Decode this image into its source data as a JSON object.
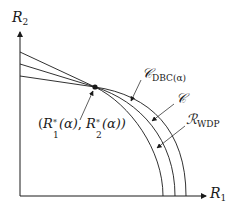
{
  "diagram": {
    "axes": {
      "y_label": {
        "symbol": "R",
        "subscript": "2"
      },
      "x_label": {
        "symbol": "R",
        "subscript": "1"
      }
    },
    "point_label": "(R₁*(α), R₂*(α))",
    "point_label_parts": {
      "open": "(",
      "r1": "R",
      "r1_sub": "1",
      "r1_sup": "*",
      "alpha1": "(α)",
      "sep": ", ",
      "r2": "R",
      "r2_sub": "2",
      "r2_sup": "*",
      "alpha2": "(α))"
    },
    "curves": [
      {
        "id": "outer",
        "label_symbol": "𝒞",
        "label_subscript": "DBC(α)"
      },
      {
        "id": "middle",
        "label_symbol": "𝒞",
        "label_subscript": ""
      },
      {
        "id": "inner",
        "label_symbol": "ℛ",
        "label_subscript": "WDP"
      }
    ],
    "colors": {
      "line": "#1a1a1a",
      "background": "#ffffff"
    }
  }
}
